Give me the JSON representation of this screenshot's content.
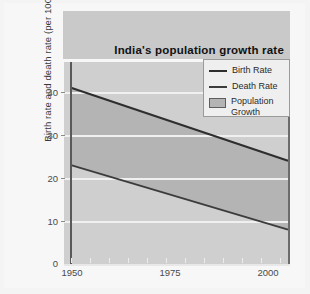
{
  "chart_data": {
    "type": "line",
    "title": "India's population growth rate",
    "xlabel": "",
    "ylabel": "Birth rate and death rate (per 1000)",
    "xlim": [
      1950,
      2007
    ],
    "ylim": [
      0,
      47
    ],
    "x_ticks": [
      1950,
      1975,
      2000
    ],
    "y_ticks": [
      0,
      10,
      20,
      30,
      40
    ],
    "grid": "horizontal",
    "legend_position": "top-right",
    "series": [
      {
        "name": "Birth Rate",
        "x": [
          1950,
          2007
        ],
        "values": [
          41,
          24
        ],
        "color": "#2e2e2e"
      },
      {
        "name": "Death Rate",
        "x": [
          1950,
          2007
        ],
        "values": [
          23,
          8
        ],
        "color": "#3c3c3c"
      }
    ],
    "fill_between": {
      "name": "Population Growth",
      "upper_series": "Birth Rate",
      "lower_series": "Death Rate",
      "color": "#b4b4b4"
    },
    "annotations": []
  },
  "title": {
    "text": "India's population growth rate"
  },
  "axes": {
    "y_title": "Birth rate and death rate (per 1000)",
    "y_ticks": [
      "40",
      "30",
      "20",
      "10",
      "0"
    ],
    "x_ticks": [
      "1950",
      "1975",
      "2000"
    ]
  },
  "legend": {
    "items": [
      {
        "label": "Birth Rate",
        "marker": "line"
      },
      {
        "label": "Death Rate",
        "marker": "line"
      },
      {
        "label": "Population\nGrowth",
        "marker": "box"
      }
    ]
  },
  "colors": {
    "band_fill": "#b4b4b4",
    "plot_background": "#cfcfcf",
    "header_band": "#c9c9c9",
    "birth_line": "#2e2e2e",
    "death_line": "#3c3c3c",
    "gridline": "#f0f0f0"
  }
}
